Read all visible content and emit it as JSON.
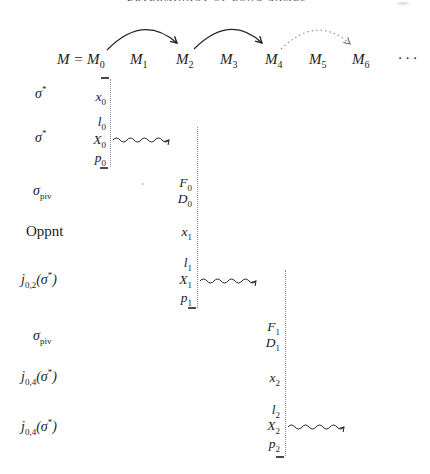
{
  "header": {
    "running_title": "DETERMINACY OF LONG GAMES"
  },
  "sequence": {
    "items": [
      "M = M_{0}",
      "M_{1}",
      "M_{2}",
      "M_{3}",
      "M_{4}",
      "M_{5}",
      "M_{6}"
    ],
    "ellipsis": "· · ·"
  },
  "rows": {
    "labels": [
      "σ^{*}",
      "σ^{*}",
      "σ_{piv}",
      "Oppnt",
      "j_{0,2}(σ^{*})",
      "σ_{piv}",
      "j_{0,4}(σ^{*})",
      "j_{0,4}(σ^{*})"
    ]
  },
  "columns": {
    "col1": {
      "x": "x_{0}",
      "l": "l_{0}",
      "X": "X_{0}",
      "p": "p_{0}"
    },
    "col2": {
      "F": "F_{0}",
      "D": "D_{0}",
      "x": "x_{1}",
      "l": "l_{1}",
      "X": "X_{1}",
      "p": "p_{1}"
    },
    "col3": {
      "F": "F_{1}",
      "D": "D_{1}",
      "x": "x_{2}",
      "l": "l_{2}",
      "X": "X_{2}",
      "p": "p_{2}"
    }
  },
  "colors": {
    "ink": "#1c1c1c",
    "dotted_line": "#8f8f8f",
    "faint_gray": "#d7d7d7"
  }
}
